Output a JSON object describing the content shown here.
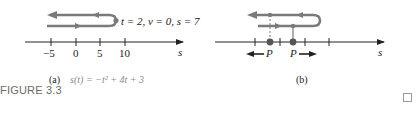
{
  "figure": {
    "label": "FIGURE 3.3",
    "end_mark": "□",
    "colors": {
      "path": "#7a7a7a",
      "axis": "#222222",
      "text": "#222222",
      "caption_formula": "#8a8a8a"
    }
  },
  "panel_a": {
    "caption_tag": "(a)",
    "caption_formula": "s(t) = −t² + 4t + 3",
    "turn_label": "t = 2, v = 0, s = 7",
    "axis_label": "s",
    "ticks": [
      "−5",
      "0",
      "5",
      "10"
    ]
  },
  "panel_b": {
    "caption_tag": "(b)",
    "axis_label": "s",
    "point_left": "P",
    "point_right": "P"
  }
}
